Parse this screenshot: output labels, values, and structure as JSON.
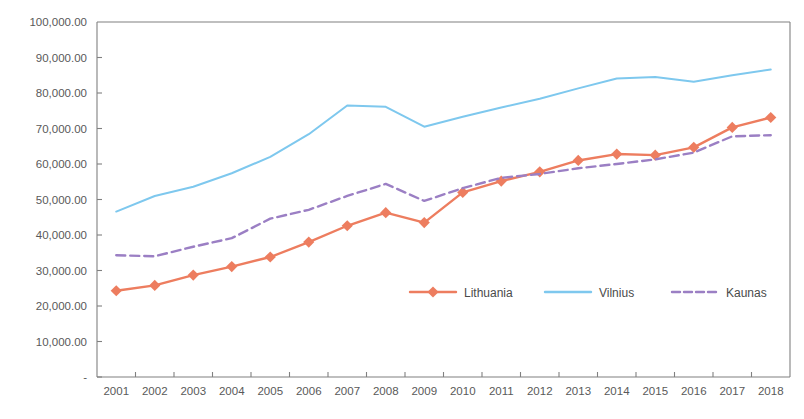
{
  "chart_data": {
    "type": "line",
    "title": "",
    "xlabel": "",
    "ylabel": "",
    "categories": [
      "2001",
      "2002",
      "2003",
      "2004",
      "2005",
      "2006",
      "2007",
      "2008",
      "2009",
      "2010",
      "2011",
      "2012",
      "2013",
      "2014",
      "2015",
      "2016",
      "2017",
      "2018"
    ],
    "ylim": [
      0,
      100000
    ],
    "ytick_values": [
      0,
      10000,
      20000,
      30000,
      40000,
      50000,
      60000,
      70000,
      80000,
      90000,
      100000
    ],
    "ytick_labels": [
      "-",
      "10,000.00",
      "20,000.00",
      "30,000.00",
      "40,000.00",
      "50,000.00",
      "60,000.00",
      "70,000.00",
      "80,000.00",
      "90,000.00",
      "100,000.00"
    ],
    "grid": false,
    "legend_position": "center",
    "series": [
      {
        "name": "Lithuania",
        "color": "#ED7D5F",
        "style": "solid",
        "marker": "diamond",
        "values": [
          24300,
          25800,
          28700,
          31100,
          33800,
          38000,
          42600,
          46300,
          43500,
          52000,
          55200,
          57800,
          61000,
          62800,
          62500,
          64700,
          70300,
          73100
        ]
      },
      {
        "name": "Vilnius",
        "color": "#7EC8EE",
        "style": "solid",
        "marker": "none",
        "values": [
          46600,
          51000,
          53600,
          57400,
          62000,
          68400,
          76500,
          76100,
          70500,
          73300,
          75900,
          78400,
          81300,
          84100,
          84500,
          83200,
          85000,
          86600
        ]
      },
      {
        "name": "Kaunas",
        "color": "#9B7FC4",
        "style": "dashed",
        "marker": "none",
        "values": [
          34300,
          34000,
          36700,
          39100,
          44600,
          47100,
          51000,
          54400,
          49600,
          53200,
          56100,
          57200,
          58800,
          60000,
          61300,
          63200,
          67800,
          68100
        ]
      }
    ]
  },
  "legend": {
    "items": [
      {
        "label": "Lithuania"
      },
      {
        "label": "Vilnius"
      },
      {
        "label": "Kaunas"
      }
    ]
  }
}
